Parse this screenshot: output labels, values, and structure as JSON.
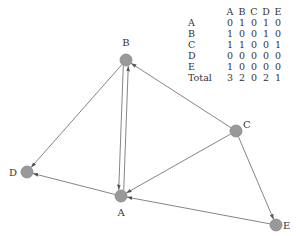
{
  "graph": {
    "nodes": [
      {
        "id": "A",
        "label": "A",
        "x": 121,
        "y": 196,
        "lx": 121,
        "ly": 216,
        "anchor": "middle"
      },
      {
        "id": "B",
        "label": "B",
        "x": 126,
        "y": 60,
        "lx": 126,
        "ly": 46,
        "anchor": "middle"
      },
      {
        "id": "C",
        "label": "C",
        "x": 236,
        "y": 131,
        "lx": 243,
        "ly": 128,
        "anchor": "start"
      },
      {
        "id": "D",
        "label": "D",
        "x": 27,
        "y": 172,
        "lx": 17,
        "ly": 176,
        "anchor": "end"
      },
      {
        "id": "E",
        "label": "E",
        "x": 276,
        "y": 225,
        "lx": 283,
        "ly": 229,
        "anchor": "start"
      }
    ],
    "edges": [
      {
        "from": "A",
        "to": "B"
      },
      {
        "from": "A",
        "to": "D"
      },
      {
        "from": "B",
        "to": "A"
      },
      {
        "from": "B",
        "to": "D"
      },
      {
        "from": "C",
        "to": "A"
      },
      {
        "from": "C",
        "to": "B"
      },
      {
        "from": "C",
        "to": "E"
      },
      {
        "from": "E",
        "to": "A"
      }
    ],
    "colors": {
      "node_fill": "#999999",
      "node_stroke": "#888888",
      "edge": "#777777",
      "text": "#333333"
    }
  },
  "table": {
    "columns": [
      "A",
      "B",
      "C",
      "D",
      "E"
    ],
    "rows": [
      {
        "label": "A",
        "values": [
          "0",
          "1",
          "0",
          "1",
          "0"
        ]
      },
      {
        "label": "B",
        "values": [
          "1",
          "0",
          "0",
          "1",
          "0"
        ]
      },
      {
        "label": "C",
        "values": [
          "1",
          "1",
          "0",
          "0",
          "1"
        ]
      },
      {
        "label": "D",
        "values": [
          "0",
          "0",
          "0",
          "0",
          "0"
        ]
      },
      {
        "label": "E",
        "values": [
          "1",
          "0",
          "0",
          "0",
          "0"
        ]
      },
      {
        "label": "Total",
        "values": [
          "3",
          "2",
          "0",
          "2",
          "1"
        ]
      }
    ]
  }
}
